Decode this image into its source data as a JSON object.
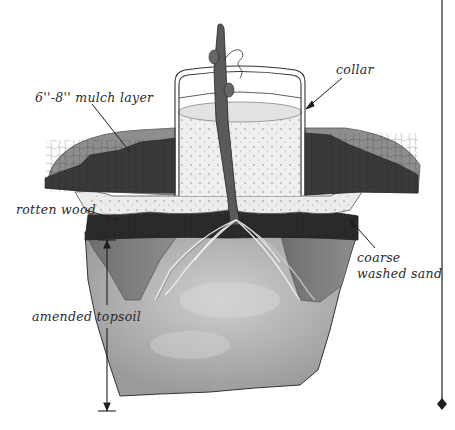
{
  "diagram": {
    "labels": {
      "mulch": "6''-8'' mulch layer",
      "collar": "collar",
      "rotten_wood": "rotten wood",
      "sand_line1": "coarse",
      "sand_line2": "washed sand",
      "topsoil": "amended topsoil"
    },
    "colors": {
      "mulch_dark": "#3a3a3a",
      "mulch_light": "#8c8c8c",
      "rotten_wood": "#2b2b2b",
      "sand": "#e8e8e8",
      "topsoil_side": "#7d7d7d",
      "topsoil_center": "#b4b4b4",
      "stem": "#5a5a5a",
      "line": "#1e1e1e"
    }
  }
}
